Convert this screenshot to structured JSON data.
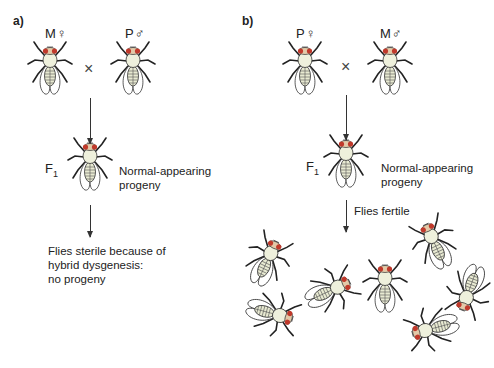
{
  "panels": {
    "a": {
      "label": "a)",
      "parent_left": "M♀",
      "parent_right": "P♂",
      "cross_symbol": "×",
      "f1_label": "F",
      "f1_subscript": "1",
      "f1_description_line1": "Normal-appearing",
      "f1_description_line2": "progeny",
      "outcome_line1": "Flies sterile because of",
      "outcome_line2": "hybrid dysgenesis:",
      "outcome_line3": "no progeny"
    },
    "b": {
      "label": "b)",
      "parent_left": "P♀",
      "parent_right": "M♂",
      "cross_symbol": "×",
      "f1_label": "F",
      "f1_subscript": "1",
      "f1_description_line1": "Normal-appearing",
      "f1_description_line2": "progeny",
      "arrow_label": "Flies fertile",
      "progeny_count": 7
    }
  },
  "colors": {
    "fly_body": "#eef0dc",
    "fly_outline": "#333333",
    "fly_eye": "#c0392b",
    "fly_thorax": "#e9ead0",
    "text": "#222222"
  }
}
